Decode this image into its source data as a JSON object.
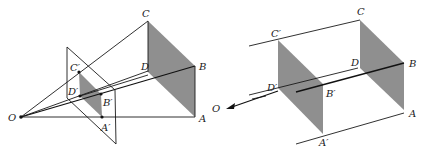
{
  "figure": {
    "left_panel": {
      "description": "Central projection from point O onto a picture plane",
      "labels": {
        "O": "O",
        "A": "A",
        "B": "B",
        "C": "C",
        "D": "D",
        "A_prime": "A′",
        "B_prime": "B′",
        "C_prime": "C′",
        "D_prime": "D′"
      }
    },
    "right_panel": {
      "description": "Parallel projection toward O (at infinity)",
      "labels": {
        "O": "O",
        "A": "A",
        "B": "B",
        "C": "C",
        "D": "D",
        "A_prime": "A′",
        "B_prime": "B′",
        "C_prime": "C′",
        "D_prime": "D′"
      }
    },
    "colors": {
      "line": "#1a1a1a",
      "shade": "#8f8f8f",
      "background": "#ffffff"
    }
  }
}
